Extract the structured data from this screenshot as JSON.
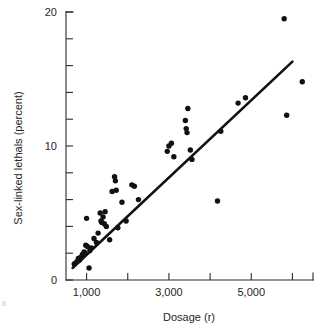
{
  "figure": {
    "page_number": "8"
  },
  "chart_data": {
    "type": "scatter",
    "title": "",
    "xlabel": "Dosage (r)",
    "ylabel": "Sex-linked lethals (percent)",
    "xlim": [
      500,
      6500
    ],
    "ylim": [
      0,
      20
    ],
    "grid": false,
    "legend": null,
    "x_ticks": [
      1000,
      2000,
      3000,
      4000,
      5000,
      6000
    ],
    "x_tick_labels": [
      "1,000",
      "",
      "3,000",
      "",
      "5,000",
      ""
    ],
    "y_ticks": [
      0,
      2,
      4,
      6,
      8,
      10,
      12,
      14,
      16,
      18,
      20
    ],
    "y_tick_labels": [
      "0",
      "",
      "",
      "",
      "",
      "10",
      "",
      "",
      "",
      "",
      "20"
    ],
    "series": [
      {
        "name": "observations",
        "marker": "filled-circle",
        "color": "#111111",
        "points": [
          [
            700,
            1.2
          ],
          [
            740,
            1.3
          ],
          [
            780,
            1.4
          ],
          [
            800,
            1.6
          ],
          [
            830,
            1.5
          ],
          [
            860,
            1.7
          ],
          [
            900,
            1.9
          ],
          [
            940,
            2.1
          ],
          [
            960,
            2.0
          ],
          [
            980,
            2.6
          ],
          [
            1000,
            4.6
          ],
          [
            1020,
            2.5
          ],
          [
            1060,
            0.9
          ],
          [
            1080,
            2.2
          ],
          [
            1120,
            2.4
          ],
          [
            1180,
            3.1
          ],
          [
            1240,
            2.8
          ],
          [
            1280,
            3.5
          ],
          [
            1330,
            5.0
          ],
          [
            1350,
            4.4
          ],
          [
            1370,
            4.3
          ],
          [
            1400,
            4.7
          ],
          [
            1430,
            4.2
          ],
          [
            1450,
            5.1
          ],
          [
            1480,
            4.0
          ],
          [
            1560,
            3.0
          ],
          [
            1620,
            6.6
          ],
          [
            1680,
            7.7
          ],
          [
            1700,
            7.4
          ],
          [
            1720,
            6.7
          ],
          [
            1760,
            3.9
          ],
          [
            1860,
            5.8
          ],
          [
            1960,
            4.4
          ],
          [
            2100,
            7.1
          ],
          [
            2160,
            7.0
          ],
          [
            2260,
            6.0
          ],
          [
            2960,
            9.6
          ],
          [
            3000,
            10.0
          ],
          [
            3060,
            10.2
          ],
          [
            3120,
            9.2
          ],
          [
            3400,
            11.9
          ],
          [
            3420,
            11.3
          ],
          [
            3440,
            11.0
          ],
          [
            3460,
            12.8
          ],
          [
            3520,
            9.7
          ],
          [
            3560,
            9.0
          ],
          [
            4180,
            5.9
          ],
          [
            4260,
            11.1
          ],
          [
            4680,
            13.2
          ],
          [
            4860,
            13.6
          ],
          [
            5800,
            19.5
          ],
          [
            5860,
            12.3
          ],
          [
            6240,
            14.8
          ]
        ]
      }
    ],
    "fit_line": {
      "name": "regression-line",
      "color": "#111111",
      "from": [
        660,
        0.9
      ],
      "to": [
        6000,
        16.3
      ]
    }
  }
}
